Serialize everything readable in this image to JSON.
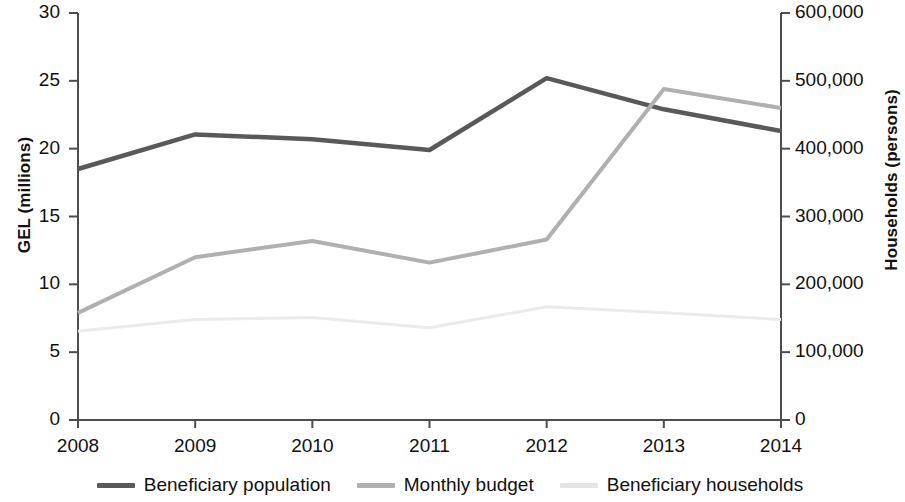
{
  "chart_data": {
    "type": "line",
    "title": "",
    "subtitle": "",
    "xlabel": "",
    "ylabel": "GEL (millions)",
    "y2label": "Households (persons)",
    "x": [
      "2008",
      "2009",
      "2010",
      "2011",
      "2012",
      "2013",
      "2014"
    ],
    "xtick_labels": [
      "2008",
      "2009",
      "2010",
      "2011",
      "2012",
      "2013",
      "2014"
    ],
    "ylim": [
      0,
      30
    ],
    "ytick_labels": [
      "0",
      "5",
      "10",
      "15",
      "20",
      "25",
      "30"
    ],
    "ytick_values": [
      0,
      5,
      10,
      15,
      20,
      25,
      30
    ],
    "y2lim": [
      0,
      600000
    ],
    "y2tick_labels": [
      "0",
      "100,000",
      "200,000",
      "300,000",
      "400,000",
      "500,000",
      "600,000"
    ],
    "y2tick_values": [
      0,
      100000,
      200000,
      300000,
      400000,
      500000,
      600000
    ],
    "grid": false,
    "legend_position": "bottom",
    "series": [
      {
        "name": "Beneficiary population",
        "axis": "right",
        "color": "#595959",
        "width": 4.5,
        "values_right_axis": [
          370000,
          421000,
          414000,
          398000,
          504000,
          458000,
          426000
        ],
        "values": [
          18.5,
          21.05,
          20.7,
          19.9,
          25.2,
          22.9,
          21.3
        ]
      },
      {
        "name": "Monthly budget",
        "axis": "left",
        "color": "#b0b0b0",
        "width": 4.0,
        "values": [
          7.9,
          12.0,
          13.2,
          11.6,
          13.3,
          24.4,
          23.0
        ]
      },
      {
        "name": "Beneficiary households",
        "axis": "right",
        "color": "#ebebeb",
        "width": 3.0,
        "values_right_axis": [
          131000,
          148000,
          151000,
          136000,
          167000,
          158000,
          148000
        ],
        "values": [
          6.55,
          7.4,
          7.55,
          6.8,
          8.35,
          7.9,
          7.4
        ]
      }
    ]
  },
  "axes": {
    "left_title": "GEL (millions)",
    "right_title": "Households (persons)"
  },
  "legend": {
    "items": [
      {
        "label": "Beneficiary population",
        "color": "#595959"
      },
      {
        "label": "Monthly budget",
        "color": "#b0b0b0"
      },
      {
        "label": "Beneficiary households",
        "color": "#e4e4e4"
      }
    ]
  }
}
